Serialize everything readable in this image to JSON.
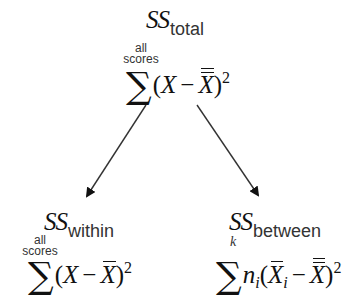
{
  "diagram": {
    "type": "tree",
    "nodes": {
      "total": {
        "ss_symbol": "SS",
        "ss_subscript": "total",
        "limit_line1": "all",
        "limit_line2": "scores",
        "sigma": "∑",
        "formula": {
          "open": "(",
          "var": "X",
          "minus": "−",
          "mean": "X",
          "mean_bars": "double",
          "close": ")",
          "exponent": "2"
        }
      },
      "within": {
        "ss_symbol": "SS",
        "ss_subscript": "within",
        "limit_line1": "all",
        "limit_line2": "scores",
        "sigma": "∑",
        "formula": {
          "open": "(",
          "var": "X",
          "minus": "−",
          "mean": "X",
          "mean_bars": "single",
          "close": ")",
          "exponent": "2"
        }
      },
      "between": {
        "ss_symbol": "SS",
        "ss_subscript": "between",
        "limit_k": "k",
        "sigma": "∑",
        "formula": {
          "n": "n",
          "n_sub": "i",
          "open": "(",
          "group_mean": "X",
          "group_mean_sub": "i",
          "minus": "−",
          "grand_mean": "X",
          "grand_mean_bars": "double",
          "close": ")",
          "exponent": "2"
        }
      }
    },
    "edges": [
      {
        "from": "total",
        "to": "within"
      },
      {
        "from": "total",
        "to": "between"
      }
    ],
    "colors": {
      "text": "#111111",
      "arrow": "#222222",
      "background": "#ffffff"
    }
  }
}
